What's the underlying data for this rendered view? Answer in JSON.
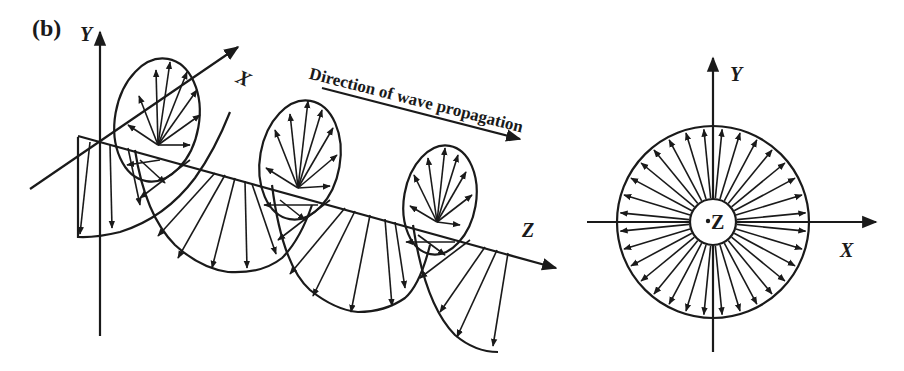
{
  "figure": {
    "panel_label": "(b)",
    "left_diagram": {
      "description": "3D helical wave with field vectors spiralling around the propagation axis",
      "axis_labels": {
        "y": "Y",
        "x": "X",
        "z": "Z"
      },
      "propagation_label": "Direction of wave propagation"
    },
    "right_diagram": {
      "description": "Cross-section view: radial vectors in a circle around the propagation axis",
      "axis_labels": {
        "y": "Y",
        "x": "X",
        "center": "Z"
      },
      "radial_arrow_count": 32
    },
    "colors": {
      "line": "#1a1a1a",
      "background": "#ffffff"
    }
  }
}
